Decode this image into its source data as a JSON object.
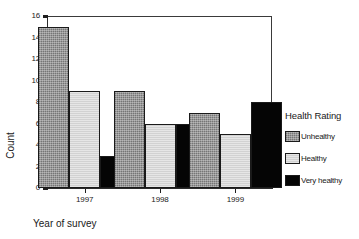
{
  "chart_data": {
    "type": "bar",
    "title": "",
    "xlabel": "Year of survey",
    "ylabel": "Count",
    "categories": [
      "1997",
      "1998",
      "1999"
    ],
    "series": [
      {
        "name": "Unhealthy",
        "values": [
          15,
          9,
          7
        ],
        "color": "#8c8c8c"
      },
      {
        "name": "Healthy",
        "values": [
          9,
          6,
          5
        ],
        "color": "#d2d2d2"
      },
      {
        "name": "Very healthy",
        "values": [
          3,
          6,
          8
        ],
        "color": "#050505"
      }
    ],
    "ylim": [
      0,
      16
    ],
    "yticks": [
      0,
      2,
      4,
      6,
      8,
      10,
      12,
      14,
      16
    ],
    "grid": false,
    "legend_position": "right",
    "legend_title": "Health Rating"
  },
  "axes": {
    "y_title": "Count",
    "x_title": "Year of survey",
    "y_tick_labels": [
      "0",
      "2",
      "4",
      "6",
      "8",
      "10",
      "12",
      "14",
      "16"
    ],
    "x_tick_labels": [
      "1997",
      "1998",
      "1999"
    ]
  },
  "legend": {
    "title": "Health Rating",
    "items": [
      {
        "label": "Unhealthy",
        "swatch": "swatch-unhealthy"
      },
      {
        "label": "Healthy",
        "swatch": "swatch-healthy"
      },
      {
        "label": "Very healthy",
        "swatch": "swatch-very-healthy"
      }
    ]
  }
}
